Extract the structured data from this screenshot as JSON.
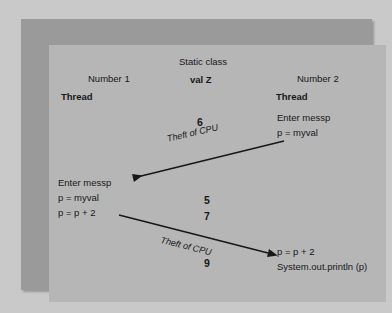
{
  "figure": {
    "type": "sequence-diagram",
    "colors": {
      "outer_margin": "#c9c9c9",
      "frame_band": "#9a9a9a",
      "panel": "#b6b6b6",
      "ink": "#16181a"
    }
  },
  "headers": {
    "left": {
      "line1": "Number 1",
      "line2": "Thread"
    },
    "center": {
      "line1": "Static class",
      "line2": "val Z"
    },
    "right": {
      "line1": "Number 2",
      "line2": "Thread"
    }
  },
  "blocks": {
    "right_top": {
      "line1": "Enter messp",
      "line2": "p = myval"
    },
    "left_middle": {
      "line1": "Enter messp",
      "line2": "p = myval",
      "line3": "p = p + 2"
    },
    "right_bottom": {
      "line1": "p = p + 2",
      "line2": "System.out.println (p)"
    }
  },
  "annotations": {
    "value_6": "6",
    "theft_1": "Theft of CPU",
    "value_5": "5",
    "value_7": "7",
    "theft_2": "Theft of CPU",
    "value_9": "9"
  }
}
